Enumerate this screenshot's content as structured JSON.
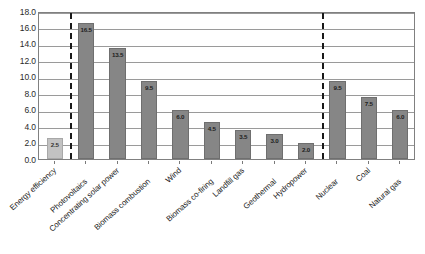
{
  "chart_data": {
    "type": "bar",
    "title": "",
    "xlabel": "",
    "ylabel": "",
    "ylim": [
      0.0,
      18.0
    ],
    "ytick_step": 2.0,
    "grid": true,
    "legend": "none",
    "categories": [
      "Energy efficiency",
      "Photovoltaics",
      "Concentrating solar power",
      "Biomass combustion",
      "Wind",
      "Biomass co-firing",
      "Landfill gas",
      "Geothermal",
      "Hydropower",
      "Nuclear",
      "Coal",
      "Natural gas"
    ],
    "values": [
      2.5,
      16.5,
      13.5,
      9.5,
      6.0,
      4.5,
      3.5,
      3.0,
      2.0,
      9.5,
      7.5,
      6.0
    ],
    "value_labels": [
      "2.5",
      "16.5",
      "13.5",
      "9.5",
      "6.0",
      "4.5",
      "3.5",
      "3.0",
      "2.0",
      "9.5",
      "7.5",
      "6.0"
    ],
    "ytick_labels": [
      "18.0",
      "16.0",
      "14.0",
      "12.0",
      "10.0",
      "8.0",
      "6.0",
      "4.0",
      "2.0",
      "0.0"
    ],
    "ytick_values": [
      18.0,
      16.0,
      14.0,
      12.0,
      10.0,
      8.0,
      6.0,
      4.0,
      2.0,
      0.0
    ],
    "bar_colors": [
      "#c2c2c2",
      "#868686",
      "#868686",
      "#868686",
      "#868686",
      "#868686",
      "#868686",
      "#868686",
      "#868686",
      "#868686",
      "#868686",
      "#868686"
    ],
    "dividers": [
      {
        "after_category": "Energy efficiency",
        "style": "dashed"
      },
      {
        "after_category": "Hydropower",
        "style": "dashed"
      }
    ],
    "annotations": []
  },
  "caption": {
    "text": ""
  },
  "colors": {
    "bar_primary": "#868686",
    "bar_secondary": "#c2c2c2",
    "gridline": "#9a9a9a",
    "axis": "#808080",
    "divider": "#1a1a1a",
    "text": "#232323"
  }
}
